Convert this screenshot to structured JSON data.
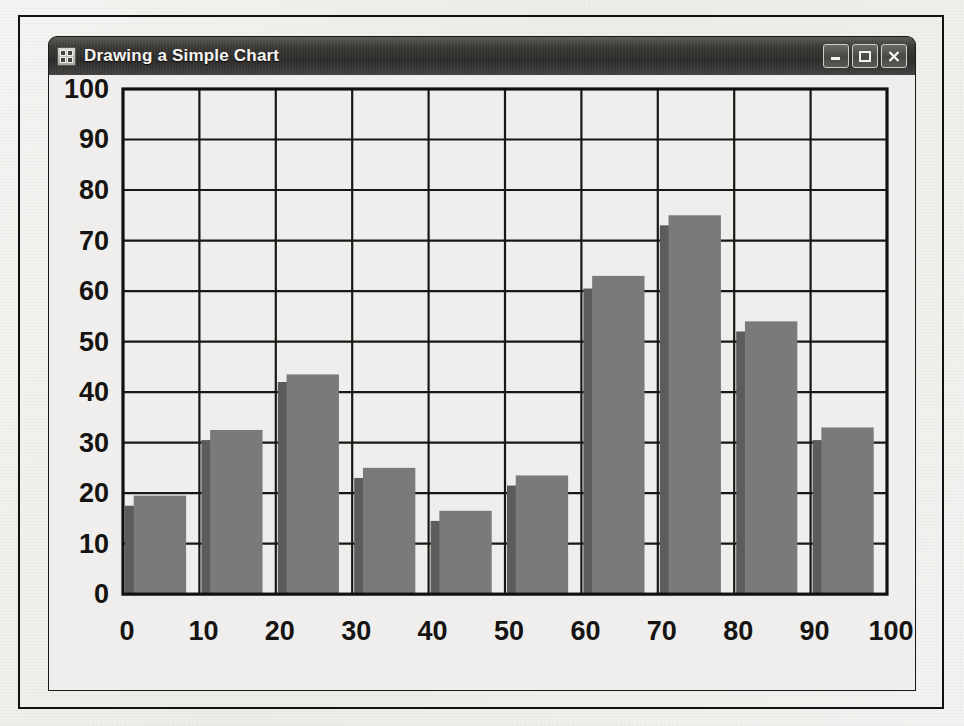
{
  "window": {
    "title": "Drawing a Simple Chart",
    "icon": "application-chart-icon",
    "buttons": [
      {
        "name": "minimize-button",
        "label": "Minimize"
      },
      {
        "name": "maximize-button",
        "label": "Maximize"
      },
      {
        "name": "close-button",
        "label": "Close"
      }
    ]
  },
  "colors": {
    "bar_face": "#7c7a78",
    "bar_shadow": "#5e5c5a",
    "grid": "#1a1816",
    "axis": "#121110",
    "plot_background": "#efeeec",
    "title_bar": "#3b3936",
    "page_background": "#f2f1ef"
  },
  "chart_data": {
    "type": "bar",
    "title": "",
    "xlabel": "",
    "ylabel": "",
    "xlim": [
      0,
      100
    ],
    "ylim": [
      0,
      100
    ],
    "grid": true,
    "legend": false,
    "xticks": [
      0,
      10,
      20,
      30,
      40,
      50,
      60,
      70,
      80,
      90,
      100
    ],
    "yticks": [
      0,
      10,
      20,
      30,
      40,
      50,
      60,
      70,
      80,
      90,
      100
    ],
    "xtick_labels": [
      "0",
      "10",
      "20",
      "30",
      "40",
      "50",
      "60",
      "70",
      "80",
      "90",
      "100"
    ],
    "ytick_labels": [
      "0",
      "10",
      "20",
      "30",
      "40",
      "50",
      "60",
      "70",
      "80",
      "90",
      "100"
    ],
    "bar_width": 8,
    "categories": [
      0,
      10,
      20,
      30,
      40,
      50,
      60,
      70,
      80,
      90
    ],
    "values": [
      19.5,
      32.5,
      43.5,
      25,
      16.5,
      23.5,
      63,
      75,
      54,
      33
    ],
    "shadow_values": [
      17.5,
      30.5,
      42,
      23,
      14.5,
      21.5,
      60.5,
      73,
      52,
      30.5
    ]
  }
}
